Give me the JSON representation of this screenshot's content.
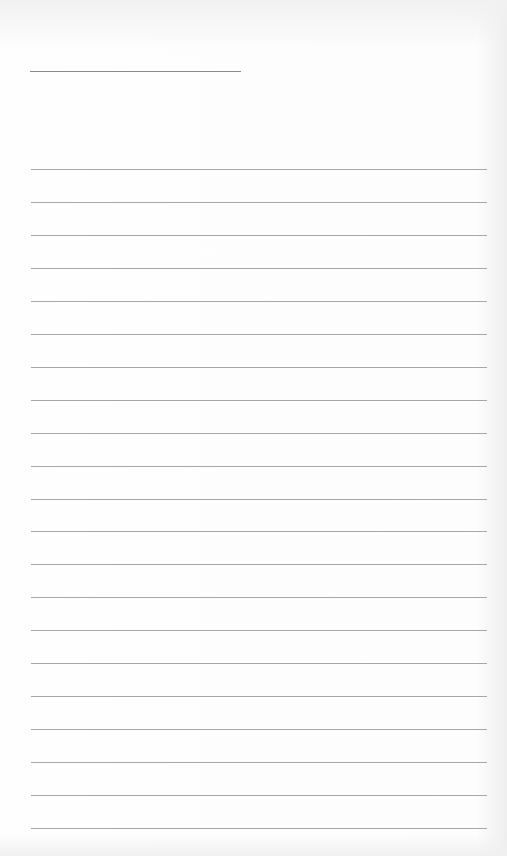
{
  "page": {
    "type": "blank lined paper",
    "title_line": {
      "x": 30,
      "y": 71,
      "width": 211
    },
    "rules": {
      "count": 21,
      "first_y": 169,
      "spacing": 32.95,
      "x": 31,
      "width": 456
    },
    "colors": {
      "paper": "#fdfdfd",
      "line": "#a8a8a8",
      "title_line": "#8a8a8a"
    }
  }
}
